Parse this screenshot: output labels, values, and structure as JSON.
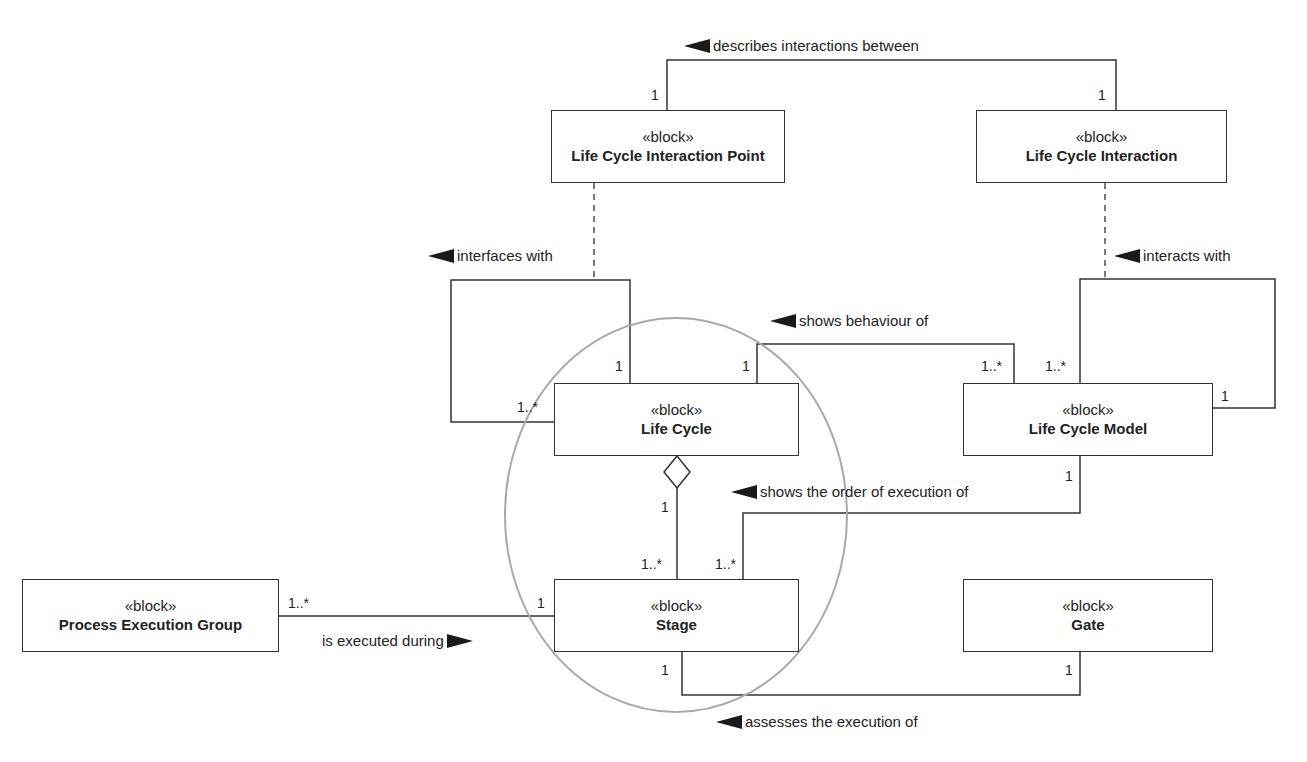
{
  "blocks": {
    "lcip": {
      "stereotype": "«block»",
      "name": "Life Cycle Interaction Point"
    },
    "lci": {
      "stereotype": "«block»",
      "name": "Life Cycle Interaction"
    },
    "lc": {
      "stereotype": "«block»",
      "name": "Life Cycle"
    },
    "lcm": {
      "stereotype": "«block»",
      "name": "Life Cycle Model"
    },
    "peg": {
      "stereotype": "«block»",
      "name": "Process Execution Group"
    },
    "stage": {
      "stereotype": "«block»",
      "name": "Stage"
    },
    "gate": {
      "stereotype": "«block»",
      "name": "Gate"
    }
  },
  "associations": {
    "describes": {
      "label": "describes interactions between",
      "direction": "left",
      "mult_a": "1",
      "mult_b": "1"
    },
    "interfaces": {
      "label": "interfaces with",
      "direction": "left",
      "mult_a": "1",
      "mult_b": "1..*"
    },
    "interacts": {
      "label": "interacts with",
      "direction": "left",
      "mult_a": "1..*",
      "mult_b": "1"
    },
    "behaviour": {
      "label": "shows behaviour of",
      "direction": "left",
      "mult_a": "1",
      "mult_b": "1..*"
    },
    "aggregation": {
      "mult_a": "1",
      "mult_b": "1..*"
    },
    "order": {
      "label": "shows the order of execution of",
      "direction": "left",
      "mult_a": "1",
      "mult_b": "1..*"
    },
    "executed": {
      "label": "is executed during",
      "direction": "right",
      "mult_a": "1..*",
      "mult_b": "1"
    },
    "assesses": {
      "label": "assesses the execution of",
      "direction": "left",
      "mult_a": "1",
      "mult_b": "1"
    }
  },
  "colors": {
    "line": "#333333",
    "highlight_circle": "#a8a8a8",
    "arrow": "#1a1a1a"
  }
}
